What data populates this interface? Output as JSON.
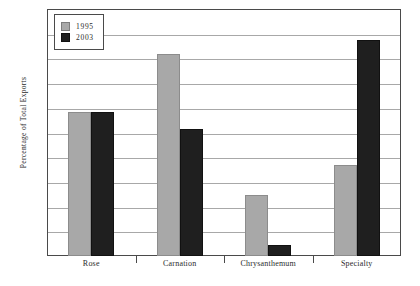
{
  "chart_data": {
    "type": "bar",
    "title": "",
    "xlabel": "",
    "ylabel": "Percentage of Total Exports",
    "categories": [
      "Rose",
      "Carnation",
      "Chrysanthemum",
      "Specialty"
    ],
    "series": [
      {
        "name": "1995",
        "color": "#a8a8a8",
        "values": [
          29.1,
          40.8,
          12.3,
          18.5
        ]
      },
      {
        "name": "2003",
        "color": "#1f1f1f",
        "values": [
          29.1,
          25.8,
          2.3,
          43.7
        ]
      }
    ],
    "ylim": [
      0,
      50
    ],
    "yticks": [
      0,
      5,
      10,
      15,
      20,
      25,
      30,
      35,
      40,
      45,
      50
    ],
    "ytick_labels": [
      "0",
      "5",
      "10",
      "15",
      "20",
      "25",
      "30",
      "35",
      "40",
      "45",
      "50"
    ],
    "grid": true,
    "legend_position": "top-left"
  }
}
